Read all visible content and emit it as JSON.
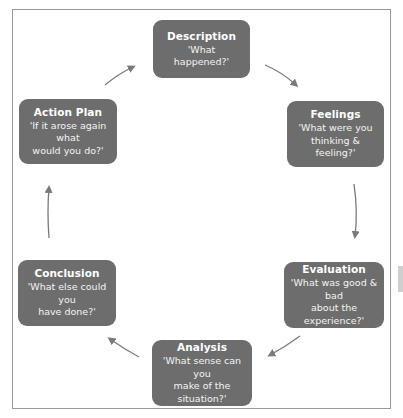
{
  "diagram": {
    "type": "cycle",
    "title": "",
    "colors": {
      "box_fill": "#6d6d6d",
      "box_text": "#ffffff",
      "arrow": "#7a7a7a",
      "frame_border": "#9a9a9a",
      "background": "#ffffff"
    },
    "stages": [
      {
        "id": "description",
        "title": "Description",
        "question": "'What happened?'"
      },
      {
        "id": "feelings",
        "title": "Feelings",
        "question_line1": "'What were you",
        "question_line2": "thinking & feeling?'"
      },
      {
        "id": "evaluation",
        "title": "Evaluation",
        "question_line1": "'What was good & bad",
        "question_line2": "about the experience?'"
      },
      {
        "id": "analysis",
        "title": "Analysis",
        "question_line1": "'What sense can you",
        "question_line2": "make of the situation?'"
      },
      {
        "id": "conclusion",
        "title": "Conclusion",
        "question_line1": "'What else could you",
        "question_line2": "have done?'"
      },
      {
        "id": "action-plan",
        "title": "Action Plan",
        "question_line1": "'If it arose again what",
        "question_line2": "would you do?'"
      }
    ],
    "flow": [
      {
        "from": "description",
        "to": "feelings"
      },
      {
        "from": "feelings",
        "to": "evaluation"
      },
      {
        "from": "evaluation",
        "to": "analysis"
      },
      {
        "from": "analysis",
        "to": "conclusion"
      },
      {
        "from": "conclusion",
        "to": "action-plan"
      },
      {
        "from": "action-plan",
        "to": "description"
      }
    ]
  }
}
